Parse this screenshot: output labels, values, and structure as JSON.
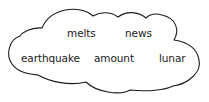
{
  "cloud": {
    "stroke_color": "#1a1a1a",
    "background_color": "#ffffff",
    "words": [
      {
        "text": "melts",
        "x": 67,
        "y": 28
      },
      {
        "text": "news",
        "x": 125,
        "y": 28
      },
      {
        "text": "earthquake",
        "x": 21,
        "y": 53
      },
      {
        "text": "amount",
        "x": 94,
        "y": 53
      },
      {
        "text": "lunar",
        "x": 159,
        "y": 53
      }
    ]
  }
}
